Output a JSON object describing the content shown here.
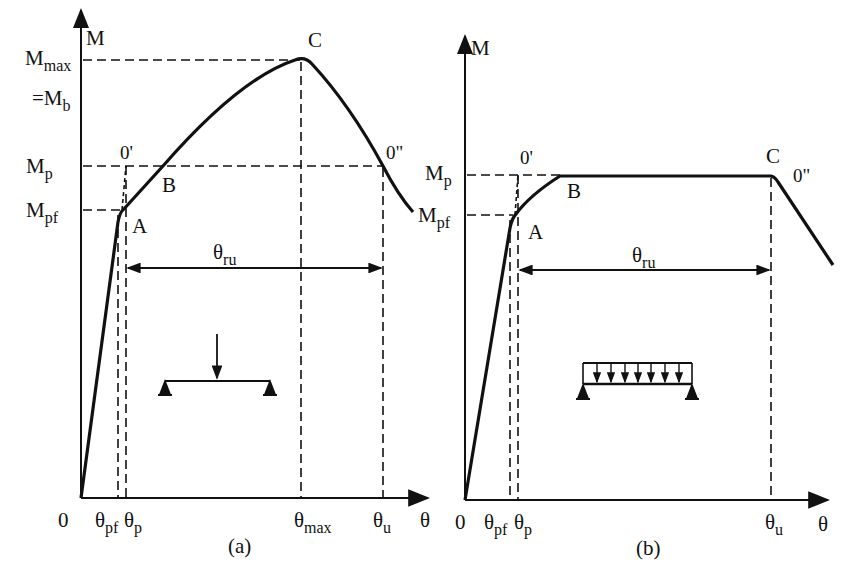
{
  "figure": {
    "panels": [
      {
        "id": "a",
        "caption": "(a)",
        "y_axis_label": "M",
        "x_axis_label": "θ",
        "origin_label": "0",
        "y_labels": {
          "mmax_main": "M",
          "mmax_sub": "max",
          "mb_main": "=M",
          "mb_sub": "b",
          "mp_main": "M",
          "mp_sub": "p",
          "mpf_main": "M",
          "mpf_sub": "pf"
        },
        "x_labels": {
          "theta_pf_main": "θ",
          "theta_pf_sub": "pf",
          "theta_p_main": "θ",
          "theta_p_sub": "p",
          "theta_max_main": "θ",
          "theta_max_sub": "max",
          "theta_u_main": "θ",
          "theta_u_sub": "u"
        },
        "points": {
          "A": "A",
          "B": "B",
          "C": "C",
          "O1": "0'",
          "O2": "0\""
        },
        "span": {
          "main": "θ",
          "sub": "ru"
        },
        "load_icon": "point-load-simply-supported-beam"
      },
      {
        "id": "b",
        "caption": "(b)",
        "y_axis_label": "M",
        "x_axis_label": "θ",
        "origin_label": "0",
        "y_labels": {
          "mp_main": "M",
          "mp_sub": "p",
          "mpf_main": "M",
          "mpf_sub": "pf"
        },
        "x_labels": {
          "theta_pf_main": "θ",
          "theta_pf_sub": "pf",
          "theta_p_main": "θ",
          "theta_p_sub": "p",
          "theta_u_main": "θ",
          "theta_u_sub": "u"
        },
        "points": {
          "A": "A",
          "B": "B",
          "C": "C",
          "O1": "0'",
          "O2": "0\""
        },
        "span": {
          "main": "θ",
          "sub": "ru"
        },
        "load_icon": "uniform-load-simply-supported-beam"
      }
    ]
  }
}
